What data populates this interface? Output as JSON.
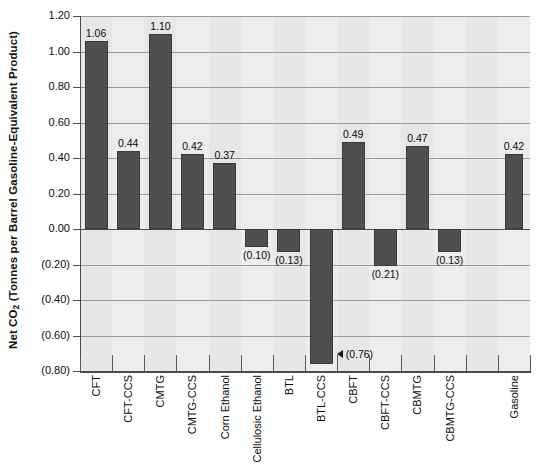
{
  "chart_data": {
    "type": "bar",
    "title": "",
    "xlabel": "",
    "ylabel": "Net CO2 (Tonnes per Barrel Gasoline-Equivalent Product)",
    "ylabel_parts": {
      "prefix": "Net CO",
      "sub": "2",
      "suffix": " (Tonnes per Barrel Gasoline-Equivalent Product)"
    },
    "ylim": [
      -0.8,
      1.2
    ],
    "ytick_step": 0.2,
    "ytick_labels": [
      "1.20",
      "1.00",
      "0.80",
      "0.60",
      "0.40",
      "0.20",
      "0.00",
      "(0.20)",
      "(0.40)",
      "(0.60)",
      "(0.80)"
    ],
    "ytick_values": [
      1.2,
      1.0,
      0.8,
      0.6,
      0.4,
      0.2,
      0.0,
      -0.2,
      -0.4,
      -0.6,
      -0.8
    ],
    "grid": true,
    "legend": "none",
    "categories": [
      "CFT",
      "CFT-CCS",
      "CMTG",
      "CMTG-CCS",
      "Corn Ethanol",
      "Cellulosic Ethanol",
      "BTL",
      "BTL-CCS",
      "CBFT",
      "CBFT-CCS",
      "CBMTG",
      "CBMTG-CCS",
      "",
      "Gasoline"
    ],
    "values": [
      1.06,
      0.44,
      1.1,
      0.42,
      0.37,
      -0.1,
      -0.13,
      -0.76,
      0.49,
      -0.21,
      0.47,
      -0.13,
      null,
      0.42
    ],
    "value_labels": [
      "1.06",
      "0.44",
      "1.10",
      "0.42",
      "0.37",
      "(0.10)",
      "(0.13)",
      "(0.76)",
      "0.49",
      "(0.21)",
      "0.47",
      "(0.13)",
      "",
      "0.42"
    ],
    "bar_color": "#4f4f4f",
    "plot_background": "#eaeaea",
    "annotations": [
      {
        "category": "BTL-CCS",
        "label": "(0.76)",
        "marker": "left-triangle"
      }
    ]
  }
}
